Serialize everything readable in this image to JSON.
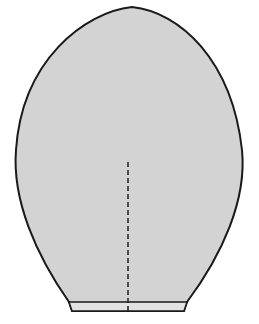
{
  "diagram": {
    "colors": {
      "fill": "#d3d3d3",
      "outline": "#1a1a1a",
      "background": "#ffffff",
      "hem_fill": "#e2e2e2"
    },
    "shape": {
      "tip": [
        132,
        7
      ],
      "widest_left": [
        15,
        160
      ],
      "widest_right": [
        243,
        160
      ],
      "base_left": [
        72,
        311
      ],
      "base_right": [
        184,
        311
      ],
      "hem_line_y": 302
    },
    "center_line": {
      "x": 128,
      "y_start": 162,
      "y_end": 311,
      "style": "dashed"
    }
  }
}
